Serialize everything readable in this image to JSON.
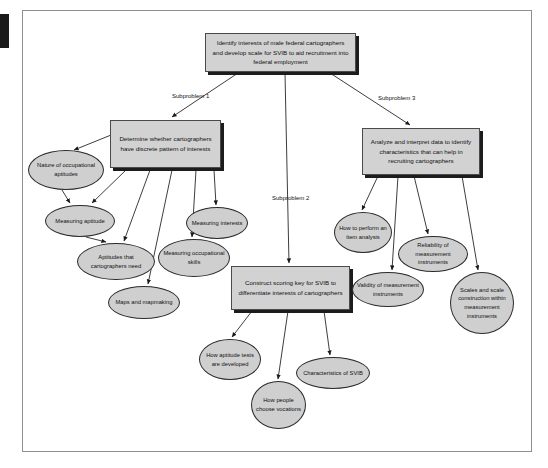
{
  "diagram": {
    "type": "hierarchy-flowchart",
    "root": {
      "id": "root",
      "label": "Identify interests of male federal cartographers and develop scale for SVIB to aid recruitment into federal employment"
    },
    "subproblem_labels": [
      {
        "id": "sub1",
        "label": "Subproblem 1"
      },
      {
        "id": "sub2",
        "label": "Subproblem 2"
      },
      {
        "id": "sub3",
        "label": "Subproblem 3"
      }
    ],
    "boxes": [
      {
        "id": "box-left",
        "label": "Determine whether cartographers have discrete pattern of interests"
      },
      {
        "id": "box-mid",
        "label": "Construct scoring key for SVIB to differentiate interests of cartographers"
      },
      {
        "id": "box-right",
        "label": "Analyze and interpret data to identify characteristics that can help in recruiting cartographers"
      }
    ],
    "ellipses": [
      {
        "id": "ell-nature",
        "label": "Nature of occupational aptitudes"
      },
      {
        "id": "ell-measapt",
        "label": "Measuring aptitude"
      },
      {
        "id": "ell-aptneed",
        "label": "Aptitudes that cartographers need"
      },
      {
        "id": "ell-maps",
        "label": "Maps and mapmaking"
      },
      {
        "id": "ell-occskills",
        "label": "Measuring occupational skills"
      },
      {
        "id": "ell-measint",
        "label": "Measuring interests"
      },
      {
        "id": "ell-itemanal",
        "label": "How to perform an item analysis"
      },
      {
        "id": "ell-reliab",
        "label": "Reliability of measurement instruments"
      },
      {
        "id": "ell-valid",
        "label": "Validity of measurement instruments"
      },
      {
        "id": "ell-scales",
        "label": "Scales and scale construction within measurement instruments"
      },
      {
        "id": "ell-aptdev",
        "label": "How aptitude tests are developed"
      },
      {
        "id": "ell-vocations",
        "label": "How people choose vocations"
      },
      {
        "id": "ell-svib",
        "label": "Characteristics of SVIB"
      }
    ],
    "colors": {
      "box_fill": "#d2d2d2",
      "ellipse_fill": "#cfcfcf",
      "shadow": "#1c1c1c",
      "border": "#2a2a2a",
      "canvas_border": "#8f8f8f",
      "margin_bar": "#1a1a1a",
      "connector": "#1a1a1a"
    }
  }
}
